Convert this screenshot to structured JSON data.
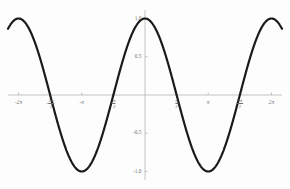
{
  "chart_data": {
    "type": "line",
    "title": "",
    "subtitle": "",
    "xlabel": "",
    "ylabel": "",
    "function": "cos(x)",
    "xlim": [
      -6.8067840828,
      6.8067840828
    ],
    "ylim": [
      -1.0,
      1.0
    ],
    "grid": false,
    "legend": null,
    "series": [
      {
        "name": "cos(x)",
        "color": "#1a1a1a",
        "linewidth": 2.2,
        "x": [
          -6.8067840828,
          -6.5,
          -6.2831853072,
          -6.0,
          -5.7595865316,
          -5.4977871438,
          -5.235987756,
          -4.9741883682,
          -4.7123889804,
          -4.4505895926,
          -4.1887902048,
          -3.926990817,
          -3.6651914292,
          -3.4033920414,
          -3.1415926536,
          -2.8797932658,
          -2.617993878,
          -2.3561944902,
          -2.0943951024,
          -1.8325957146,
          -1.5707963268,
          -1.308996939,
          -1.0471975512,
          -0.7853981634,
          -0.5235987756,
          -0.2617993878,
          0.0,
          0.2617993878,
          0.5235987756,
          0.7853981634,
          1.0471975512,
          1.308996939,
          1.5707963268,
          1.8325957146,
          2.0943951024,
          2.3561944902,
          2.617993878,
          2.8797932658,
          3.1415926536,
          3.4033920414,
          3.6651914292,
          3.926990817,
          4.1887902048,
          4.4505895926,
          4.7123889804,
          4.9741883682,
          5.235987756,
          5.4977871438,
          5.7595865316,
          6.0,
          6.2831853072,
          6.5,
          6.8067840828
        ],
        "y": [
          0.8660254038,
          0.9767268366,
          1.0,
          0.9601702867,
          0.8660254038,
          0.7071067812,
          0.5,
          0.2588190451,
          0.0,
          -0.2588190451,
          -0.5,
          -0.7071067812,
          -0.8660254038,
          -0.9659258263,
          -1.0,
          -0.9659258263,
          -0.8660254038,
          -0.7071067812,
          -0.5,
          -0.2588190451,
          0.0,
          0.2588190451,
          0.5,
          0.7071067812,
          0.8660254038,
          0.9659258263,
          1.0,
          0.9659258263,
          0.8660254038,
          0.7071067812,
          0.5,
          0.2588190451,
          0.0,
          -0.2588190451,
          -0.5,
          -0.7071067812,
          -0.8660254038,
          -0.9659258263,
          -1.0,
          -0.9659258263,
          -0.8660254038,
          -0.7071067812,
          -0.5,
          -0.2588190451,
          0.0,
          0.2588190451,
          0.5,
          0.7071067812,
          0.8660254038,
          0.9601702867,
          1.0,
          0.9767268366,
          0.8660254038
        ]
      }
    ],
    "x_ticks": [
      {
        "value": -6.2831853072,
        "label": "-2π",
        "kind": "plain"
      },
      {
        "value": -4.7123889804,
        "label": "-3π/2",
        "kind": "fraction",
        "sign": "-",
        "numerator": "3π",
        "denominator": "2"
      },
      {
        "value": -3.1415926536,
        "label": "-π",
        "kind": "plain"
      },
      {
        "value": -1.5707963268,
        "label": "-π/2",
        "kind": "fraction",
        "sign": "-",
        "numerator": "π",
        "denominator": "2"
      },
      {
        "value": 1.5707963268,
        "label": "π/2",
        "kind": "fraction",
        "sign": "",
        "numerator": "π",
        "denominator": "2"
      },
      {
        "value": 3.1415926536,
        "label": "π",
        "kind": "plain"
      },
      {
        "value": 4.7123889804,
        "label": "3π/2",
        "kind": "fraction",
        "sign": "",
        "numerator": "3π",
        "denominator": "2"
      },
      {
        "value": 6.2831853072,
        "label": "2π",
        "kind": "plain"
      }
    ],
    "y_ticks": [
      {
        "value": 1.0,
        "label": "1.0"
      },
      {
        "value": 0.5,
        "label": "0.5"
      },
      {
        "value": -0.5,
        "label": "-0.5"
      },
      {
        "value": -1.0,
        "label": "-1.0"
      }
    ],
    "axis_color": "#b4b4b4",
    "tick_label_color": "#6f6f6f",
    "background_color": "#fdfdfd"
  }
}
